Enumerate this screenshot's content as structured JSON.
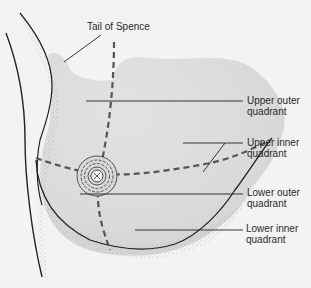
{
  "diagram": {
    "colors": {
      "background": "#f3f3f3",
      "tissue_fill": "#dcdcdc",
      "outline": "#222222",
      "dashed_divider": "#555555",
      "stipple": "#8a8a8a"
    },
    "labels": {
      "tail_of_spence": "Tail of Spence",
      "upper_outer": {
        "line1": "Upper outer",
        "line2": "quadrant"
      },
      "upper_inner": {
        "line1": "Upper inner",
        "line2": "quadrant"
      },
      "lower_outer": {
        "line1": "Lower outer",
        "line2": "quadrant"
      },
      "lower_inner": {
        "line1": "Lower inner",
        "line2": "quadrant"
      }
    }
  }
}
